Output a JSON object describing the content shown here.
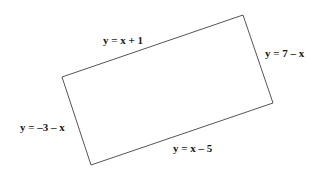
{
  "diagram": {
    "type": "rectangle-bounded-by-lines",
    "stroke_color": "#555555",
    "background": "#ffffff",
    "vertices": {
      "left": [
        62,
        77
      ],
      "top": [
        243,
        15
      ],
      "right": [
        273,
        103
      ],
      "bottom": [
        91,
        165
      ]
    },
    "labels": {
      "top_edge": "y = x + 1",
      "right_edge": "y = 7 – x",
      "left_edge": "y = –3 – x",
      "bottom_edge": "y = x – 5"
    }
  }
}
